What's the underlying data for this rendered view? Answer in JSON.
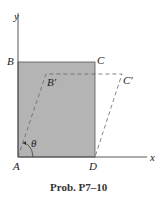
{
  "figure": {
    "caption": "Prob. P7–10",
    "axes": {
      "x_label": "x",
      "y_label": "y"
    },
    "points": {
      "A": "A",
      "B": "B",
      "C": "C",
      "D": "D",
      "B_prime": "B'",
      "C_prime": "C'"
    },
    "angle_label": "θ",
    "colors": {
      "fill": "#b4b4b4",
      "stroke": "#555555",
      "dashed": "#666666"
    }
  }
}
